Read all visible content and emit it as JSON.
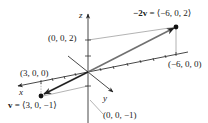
{
  "diagram": {
    "type": "3d-vector-plot",
    "axes": {
      "x_label": "x",
      "y_label": "y",
      "z_label": "z"
    },
    "points": {
      "z_two": "(0, 0, 2)",
      "x_three": "(3, 0, 0)",
      "neg_x_six": "(−6, 0, 0)",
      "z_neg_one": "(0, 0, −1)"
    },
    "vectors": {
      "v": {
        "name": "v",
        "label": "⟨3, 0, −1⟩",
        "full_label": "v = ⟨3, 0, −1⟩",
        "components": [
          3,
          0,
          -1
        ]
      },
      "neg_two_v": {
        "name": "−2v",
        "label": "⟨−6, 0, 2⟩",
        "full_label": "−2v = ⟨−6, 0, 2⟩",
        "components": [
          -6,
          0,
          2
        ]
      }
    },
    "colors": {
      "axis": "#333333",
      "vector": "#555555",
      "guide": "#999999",
      "point": "#111111",
      "text": "#222222"
    }
  }
}
